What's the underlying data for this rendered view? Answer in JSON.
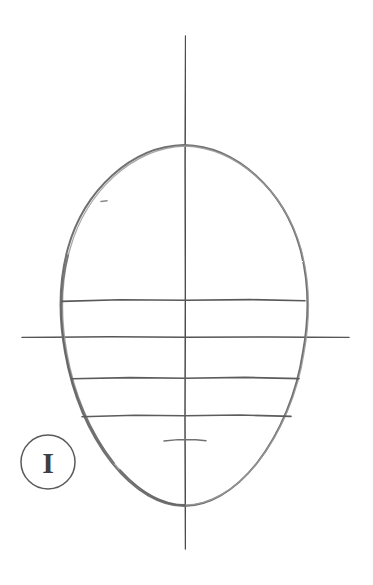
{
  "page": {
    "title": "Head Construction Study",
    "background_color": "#ffffff",
    "width": 373,
    "height": 585
  },
  "media": {
    "type": "pencil-drawing",
    "pencil_color": "#6b6b6b",
    "ink_color": "#4a4a4a",
    "line_color_dark": "#555555",
    "line_color_light": "#8d8d8d"
  },
  "figure_label": {
    "text": "I",
    "shape": "circle",
    "center_x": 48,
    "center_y": 462,
    "radius": 27,
    "stroke_color": "#5a5a5a",
    "glyph_color": "#3f3f3f"
  },
  "head_outline": {
    "name": "egg-shaped head oval",
    "center_x": 184,
    "top_y": 145,
    "bottom_y": 506,
    "left_x": 61,
    "right_x": 306,
    "widest_y": 312,
    "stroke_color": "#6e6e6e"
  },
  "axes": {
    "vertical": {
      "label": "central vertical axis",
      "x": 185,
      "y_start": 36,
      "y_end": 549
    },
    "horizontal": {
      "label": "eye line / horizontal axis",
      "y": 337,
      "x_start": 22,
      "x_end": 349
    }
  },
  "construction_lines": [
    {
      "name": "brow-line",
      "y": 300,
      "x_start": 62,
      "x_end": 305
    },
    {
      "name": "eye-line",
      "y": 337,
      "x_start": 22,
      "x_end": 349
    },
    {
      "name": "nose-line",
      "y": 378,
      "x_start": 72,
      "x_end": 299
    },
    {
      "name": "mouth-line",
      "y": 416,
      "x_start": 82,
      "x_end": 291
    },
    {
      "name": "chin-tick",
      "y": 440,
      "x_start": 164,
      "x_end": 206
    }
  ],
  "stray_marks": [
    {
      "name": "stray-pencil-dot",
      "x": 103,
      "y": 201,
      "width": 5,
      "height": 2
    }
  ]
}
